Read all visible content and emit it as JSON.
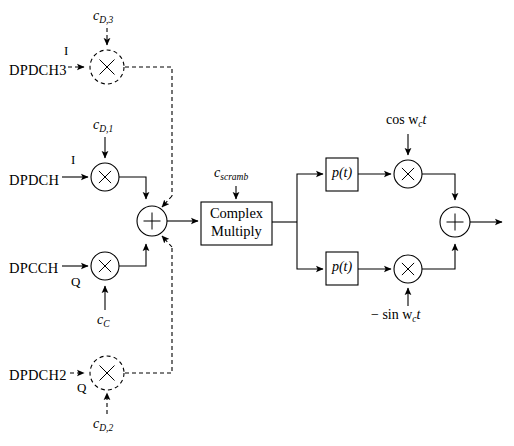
{
  "figure": {
    "type": "block-diagram",
    "width": 514,
    "height": 446,
    "background_color": "#ffffff",
    "line_color": "#000000"
  },
  "inputs": [
    {
      "id": "dpdch3",
      "label": "DPDCH3",
      "branch": "I",
      "style": "dashed",
      "x": 10,
      "y": 72
    },
    {
      "id": "dpdch",
      "label": "DPDCH",
      "branch": "I",
      "style": "solid",
      "x": 10,
      "y": 182
    },
    {
      "id": "dpcch",
      "label": "DPCCH",
      "branch": "Q",
      "style": "solid",
      "x": 10,
      "y": 271
    },
    {
      "id": "dpdch2",
      "label": "DPDCH2",
      "branch": "Q",
      "style": "dashed",
      "x": 10,
      "y": 378
    }
  ],
  "code_labels": [
    {
      "id": "c_d_3",
      "base": "c",
      "sub": "D,3",
      "x": 105,
      "y": 17,
      "style": "dashed"
    },
    {
      "id": "c_d_1",
      "base": "c",
      "sub": "D,1",
      "x": 105,
      "y": 126,
      "style": "solid"
    },
    {
      "id": "c_c",
      "base": "c",
      "sub": "C",
      "x": 105,
      "y": 320,
      "style": "solid"
    },
    {
      "id": "c_d_2",
      "base": "c",
      "sub": "D,2",
      "x": 105,
      "y": 424,
      "style": "dashed"
    },
    {
      "id": "c_scramb",
      "base": "c",
      "sub": "scramb",
      "x": 234,
      "y": 175,
      "style": "solid"
    }
  ],
  "multipliers": [
    {
      "id": "mult-dpdch3",
      "glyph": "×",
      "cx": 107,
      "cy": 67,
      "r": 17,
      "style": "dashed"
    },
    {
      "id": "mult-dpdch",
      "glyph": "×",
      "cx": 105,
      "cy": 177,
      "r": 14,
      "style": "solid"
    },
    {
      "id": "mult-dpcch",
      "glyph": "×",
      "cx": 105,
      "cy": 266,
      "r": 14,
      "style": "solid"
    },
    {
      "id": "mult-dpdch2",
      "glyph": "×",
      "cx": 105,
      "cy": 373,
      "r": 17,
      "style": "dashed"
    },
    {
      "id": "mult-cos",
      "glyph": "×",
      "cx": 408,
      "cy": 174,
      "r": 14,
      "style": "solid"
    },
    {
      "id": "mult-sin",
      "glyph": "×",
      "cx": 408,
      "cy": 269,
      "r": 14,
      "style": "solid"
    }
  ],
  "adders": [
    {
      "id": "adder-left",
      "glyph": "+",
      "cx": 152,
      "cy": 221,
      "r": 15
    },
    {
      "id": "adder-right",
      "glyph": "+",
      "cx": 455,
      "cy": 222,
      "r": 15
    }
  ],
  "boxes": [
    {
      "id": "complex-multiply",
      "lines": [
        "Complex",
        "Multiply"
      ],
      "x": 201,
      "y": 202,
      "w": 71,
      "h": 43
    },
    {
      "id": "pulse-shape-i",
      "lines": [
        "p(t)"
      ],
      "x": 326,
      "y": 158,
      "w": 32,
      "h": 33
    },
    {
      "id": "pulse-shape-q",
      "lines": [
        "p(t)"
      ],
      "x": 326,
      "y": 252,
      "w": 32,
      "h": 33
    }
  ],
  "carriers": [
    {
      "id": "carrier-cos",
      "text": "cos w",
      "sub": "c",
      "tail": "t",
      "x": 408,
      "y": 122
    },
    {
      "id": "carrier-sin",
      "text": "− sin w",
      "sub": "c",
      "tail": "t",
      "x": 408,
      "y": 316
    }
  ],
  "output": {
    "id": "modulated-output",
    "x": 500,
    "y": 222
  },
  "pulse_label": "p(t)",
  "box_labels": {
    "complex_line1": "Complex",
    "complex_line2": "Multiply"
  }
}
